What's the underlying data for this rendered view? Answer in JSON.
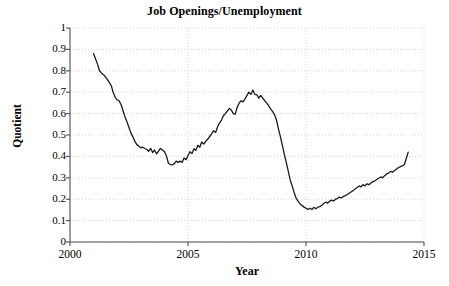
{
  "chart_data": {
    "type": "line",
    "title": "Job Openings/Unemployment",
    "xlabel": "Year",
    "ylabel": "Quotient",
    "xlim": [
      2000,
      2015
    ],
    "ylim": [
      0,
      1
    ],
    "grid": true,
    "grid_style": "dotted",
    "legend": "none",
    "line_color": "#1a1a1a",
    "line_width": 1.3,
    "background": "#ffffff",
    "xticks": [
      2000,
      2005,
      2010,
      2015
    ],
    "xtick_labels": [
      "2000",
      "2005",
      "2010",
      "2015"
    ],
    "yticks": [
      0,
      0.1,
      0.2,
      0.3,
      0.4,
      0.5,
      0.6,
      0.7,
      0.8,
      0.9,
      1
    ],
    "ytick_labels": [
      "0",
      "0.1",
      "0.2",
      "0.3",
      "0.4",
      "0.5",
      "0.6",
      "0.7",
      "0.8",
      "0.9",
      "1"
    ],
    "series": [
      {
        "name": "Job Openings/Unemployment",
        "x": [
          2001.0,
          2001.08,
          2001.17,
          2001.25,
          2001.33,
          2001.42,
          2001.5,
          2001.58,
          2001.67,
          2001.75,
          2001.83,
          2001.92,
          2002.0,
          2002.08,
          2002.17,
          2002.25,
          2002.33,
          2002.42,
          2002.5,
          2002.58,
          2002.67,
          2002.75,
          2002.83,
          2002.92,
          2003.0,
          2003.08,
          2003.17,
          2003.25,
          2003.33,
          2003.42,
          2003.5,
          2003.58,
          2003.67,
          2003.75,
          2003.83,
          2003.92,
          2004.0,
          2004.08,
          2004.17,
          2004.25,
          2004.33,
          2004.42,
          2004.5,
          2004.58,
          2004.67,
          2004.75,
          2004.83,
          2004.92,
          2005.0,
          2005.08,
          2005.17,
          2005.25,
          2005.33,
          2005.42,
          2005.5,
          2005.58,
          2005.67,
          2005.75,
          2005.83,
          2005.92,
          2006.0,
          2006.08,
          2006.17,
          2006.25,
          2006.33,
          2006.42,
          2006.5,
          2006.58,
          2006.67,
          2006.75,
          2006.83,
          2006.92,
          2007.0,
          2007.08,
          2007.17,
          2007.25,
          2007.33,
          2007.42,
          2007.5,
          2007.58,
          2007.67,
          2007.75,
          2007.83,
          2007.92,
          2008.0,
          2008.08,
          2008.17,
          2008.25,
          2008.33,
          2008.42,
          2008.5,
          2008.58,
          2008.67,
          2008.75,
          2008.83,
          2008.92,
          2009.0,
          2009.08,
          2009.17,
          2009.25,
          2009.33,
          2009.42,
          2009.5,
          2009.58,
          2009.67,
          2009.75,
          2009.83,
          2009.92,
          2010.0,
          2010.08,
          2010.17,
          2010.25,
          2010.33,
          2010.42,
          2010.5,
          2010.58,
          2010.67,
          2010.75,
          2010.83,
          2010.92,
          2011.0,
          2011.08,
          2011.17,
          2011.25,
          2011.33,
          2011.42,
          2011.5,
          2011.58,
          2011.67,
          2011.75,
          2011.83,
          2011.92,
          2012.0,
          2012.08,
          2012.17,
          2012.25,
          2012.33,
          2012.42,
          2012.5,
          2012.58,
          2012.67,
          2012.75,
          2012.83,
          2012.92,
          2013.0,
          2013.08,
          2013.17,
          2013.25,
          2013.33,
          2013.42,
          2013.5,
          2013.58,
          2013.67,
          2013.75,
          2013.83,
          2013.92,
          2014.0,
          2014.08,
          2014.17,
          2014.25,
          2014.33
        ],
        "y": [
          0.88,
          0.856,
          0.83,
          0.8,
          0.79,
          0.782,
          0.772,
          0.76,
          0.745,
          0.73,
          0.7,
          0.675,
          0.664,
          0.66,
          0.64,
          0.612,
          0.585,
          0.56,
          0.535,
          0.51,
          0.49,
          0.47,
          0.455,
          0.448,
          0.44,
          0.443,
          0.437,
          0.432,
          0.424,
          0.437,
          0.418,
          0.43,
          0.412,
          0.425,
          0.437,
          0.43,
          0.423,
          0.404,
          0.368,
          0.362,
          0.36,
          0.366,
          0.378,
          0.372,
          0.378,
          0.372,
          0.392,
          0.385,
          0.404,
          0.422,
          0.413,
          0.436,
          0.428,
          0.452,
          0.443,
          0.467,
          0.458,
          0.47,
          0.48,
          0.493,
          0.505,
          0.52,
          0.512,
          0.537,
          0.556,
          0.57,
          0.59,
          0.6,
          0.612,
          0.624,
          0.618,
          0.6,
          0.597,
          0.628,
          0.65,
          0.66,
          0.655,
          0.67,
          0.685,
          0.7,
          0.69,
          0.71,
          0.69,
          0.688,
          0.672,
          0.685,
          0.672,
          0.66,
          0.65,
          0.636,
          0.622,
          0.61,
          0.594,
          0.57,
          0.53,
          0.49,
          0.45,
          0.41,
          0.37,
          0.33,
          0.29,
          0.26,
          0.23,
          0.205,
          0.19,
          0.178,
          0.17,
          0.163,
          0.158,
          0.152,
          0.158,
          0.152,
          0.162,
          0.155,
          0.163,
          0.165,
          0.172,
          0.18,
          0.186,
          0.182,
          0.19,
          0.196,
          0.192,
          0.2,
          0.203,
          0.21,
          0.206,
          0.213,
          0.217,
          0.222,
          0.228,
          0.235,
          0.24,
          0.248,
          0.255,
          0.262,
          0.258,
          0.268,
          0.262,
          0.272,
          0.268,
          0.276,
          0.282,
          0.286,
          0.292,
          0.298,
          0.304,
          0.3,
          0.31,
          0.318,
          0.322,
          0.33,
          0.326,
          0.334,
          0.34,
          0.348,
          0.352,
          0.356,
          0.362,
          0.39,
          0.42
        ]
      }
    ],
    "annotations": []
  }
}
